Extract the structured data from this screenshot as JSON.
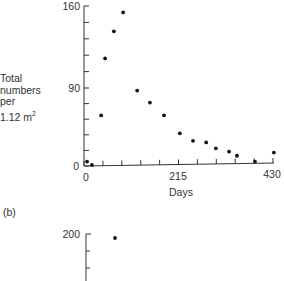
{
  "chart_data": [
    {
      "panel": "(a)",
      "type": "scatter",
      "title": "",
      "xlabel": "Days",
      "ylabel": [
        "Total",
        "numbers",
        "per",
        "1.12 m²"
      ],
      "x_ticks": [
        0,
        215,
        430
      ],
      "y_ticks": [
        0,
        90,
        160
      ],
      "xlim": [
        0,
        430
      ],
      "ylim": [
        0,
        160
      ],
      "grid": false,
      "legend": null,
      "points": [
        {
          "x": 7,
          "y": 5
        },
        {
          "x": 18,
          "y": 1
        },
        {
          "x": 39,
          "y": 58
        },
        {
          "x": 48,
          "y": 115
        },
        {
          "x": 68,
          "y": 138
        },
        {
          "x": 89,
          "y": 154
        },
        {
          "x": 121,
          "y": 86
        },
        {
          "x": 150,
          "y": 72
        },
        {
          "x": 182,
          "y": 57
        },
        {
          "x": 218,
          "y": 36
        },
        {
          "x": 248,
          "y": 27
        },
        {
          "x": 278,
          "y": 25
        },
        {
          "x": 300,
          "y": 18
        },
        {
          "x": 330,
          "y": 14
        },
        {
          "x": 348,
          "y": 9
        },
        {
          "x": 389,
          "y": 2
        },
        {
          "x": 432,
          "y": 12
        }
      ]
    },
    {
      "panel": "(b)",
      "type": "scatter",
      "y_ticks": [
        200
      ],
      "points": [
        {
          "x": 68,
          "y": 190
        }
      ],
      "note": "partially visible (cropped)"
    }
  ],
  "labels": {
    "y_line1": "Total",
    "y_line2": "numbers",
    "y_line3": "per",
    "y_line4_base": "1.12 m",
    "y_line4_sup": "2",
    "x_axis_title": "Days",
    "x_tick_0": "0",
    "x_tick_215": "215",
    "x_tick_430": "430",
    "y_tick_0": "0",
    "y_tick_90": "90",
    "y_tick_160": "160",
    "panel_b": "(b)",
    "panel_b_y_tick_200": "200"
  }
}
